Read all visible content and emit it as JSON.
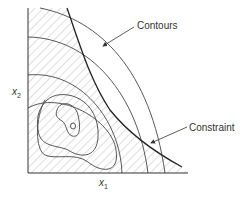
{
  "diagram": {
    "type": "constrained-optimization-contour-plot",
    "labels": {
      "contours": "Contours",
      "constraint": "Constraint"
    },
    "axes": {
      "x": {
        "var": "x",
        "sub": "1"
      },
      "y": {
        "var": "x",
        "sub": "2"
      }
    },
    "colors": {
      "line": "#333333",
      "hatch": "#bdbdbd",
      "text": "#333333"
    }
  }
}
